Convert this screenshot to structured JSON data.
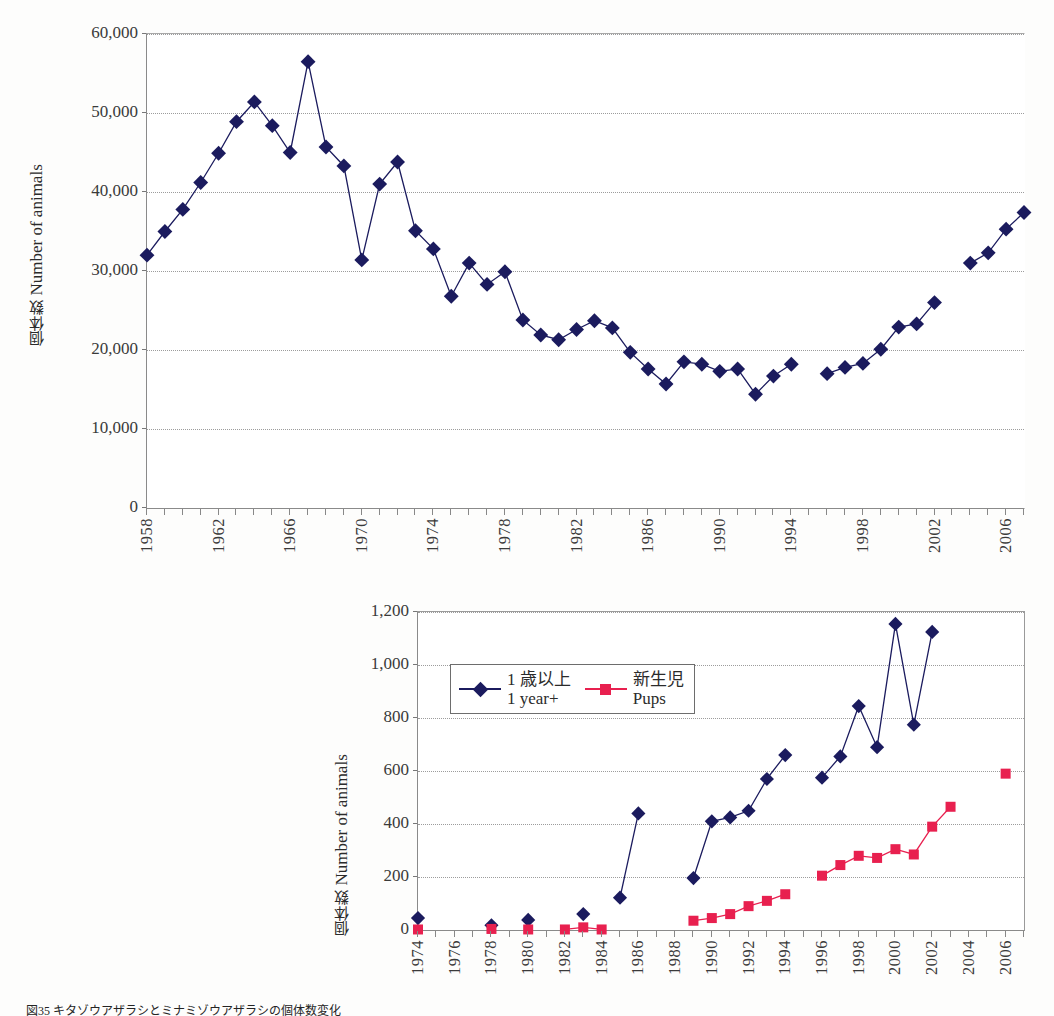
{
  "page": {
    "caption": "図35 キタゾウアザラシとミナミゾウアザラシの個体数変化"
  },
  "chart_data": [
    {
      "id": "chart-top",
      "type": "line",
      "title": "",
      "xlabel": "",
      "ylabel": "個体数 / Number of animals",
      "ylabel_jp": "個体数",
      "ylabel_en": "Number of animals",
      "ylim": [
        0,
        60000
      ],
      "yticks": [
        0,
        10000,
        20000,
        30000,
        40000,
        50000,
        60000
      ],
      "ytick_labels": [
        "0",
        "10,000",
        "20,000",
        "30,000",
        "40,000",
        "50,000",
        "60,000"
      ],
      "xlim": [
        1958,
        2007
      ],
      "xticks_labeled": [
        1958,
        1962,
        1966,
        1970,
        1974,
        1978,
        1982,
        1986,
        1990,
        1994,
        1998,
        2002,
        2006
      ],
      "xtick_step": 1,
      "grid": "horizontal-dotted",
      "legend": "none",
      "series": [
        {
          "name": "Number of animals",
          "color": "#1b1b5e",
          "marker": "diamond",
          "x": [
            1958,
            1959,
            1960,
            1961,
            1962,
            1963,
            1964,
            1965,
            1966,
            1967,
            1968,
            1969,
            1970,
            1971,
            1972,
            1973,
            1974,
            1975,
            1976,
            1977,
            1978,
            1979,
            1980,
            1981,
            1982,
            1983,
            1984,
            1985,
            1986,
            1987,
            1988,
            1989,
            1990,
            1991,
            1992,
            1993,
            1994,
            1996,
            1997,
            1998,
            1999,
            2000,
            2001,
            2002,
            2004,
            2005,
            2006,
            2007
          ],
          "values": [
            32000,
            35000,
            37800,
            41200,
            44900,
            48900,
            51400,
            48400,
            45000,
            56500,
            45700,
            43300,
            31400,
            41000,
            43800,
            35100,
            32800,
            26800,
            31000,
            28300,
            29900,
            23800,
            21900,
            21300,
            22600,
            23700,
            22800,
            19700,
            17600,
            15700,
            18500,
            18200,
            17300,
            17600,
            14400,
            16700,
            18200,
            17000,
            17800,
            18300,
            20100,
            22900,
            23300,
            26000,
            31000,
            32300,
            35300,
            37400
          ]
        }
      ]
    },
    {
      "id": "chart-bottom",
      "type": "line",
      "title": "",
      "xlabel": "",
      "ylabel": "個体数 / Number of animals",
      "ylabel_jp": "個体数",
      "ylabel_en": "Number of animals",
      "ylim": [
        0,
        1200
      ],
      "yticks": [
        0,
        200,
        400,
        600,
        800,
        1000,
        1200
      ],
      "ytick_labels": [
        "0",
        "200",
        "400",
        "600",
        "800",
        "1,000",
        "1,200"
      ],
      "xlim": [
        1974,
        2007
      ],
      "xticks_labeled": [
        1974,
        1976,
        1978,
        1980,
        1982,
        1984,
        1986,
        1988,
        1990,
        1992,
        1994,
        1996,
        1998,
        2000,
        2002,
        2004,
        2006
      ],
      "xtick_step": 1,
      "grid": "horizontal-dotted",
      "legend": "inside-top-left",
      "series": [
        {
          "name": "1 year+",
          "name_jp": "1 歳以上",
          "name_en": "1 year+",
          "color": "#1b1b5e",
          "marker": "diamond",
          "x": [
            1974,
            1978,
            1980,
            1983,
            1985,
            1986,
            1989,
            1990,
            1991,
            1992,
            1993,
            1994,
            1996,
            1997,
            1998,
            1999,
            2000,
            2001,
            2002
          ],
          "values": [
            45,
            18,
            38,
            60,
            122,
            440,
            196,
            410,
            425,
            450,
            570,
            660,
            575,
            655,
            845,
            690,
            1155,
            775,
            1125
          ]
        },
        {
          "name": "Pups",
          "name_jp": "新生児",
          "name_en": "Pups",
          "color": "#e8204f",
          "marker": "square",
          "x": [
            1974,
            1978,
            1980,
            1982,
            1983,
            1984,
            1989,
            1990,
            1991,
            1992,
            1993,
            1994,
            1996,
            1997,
            1998,
            1999,
            2000,
            2001,
            2002,
            2003,
            2006
          ],
          "values": [
            2,
            4,
            2,
            2,
            10,
            2,
            35,
            45,
            60,
            90,
            110,
            135,
            205,
            245,
            280,
            272,
            305,
            285,
            390,
            465,
            590
          ]
        }
      ]
    }
  ]
}
